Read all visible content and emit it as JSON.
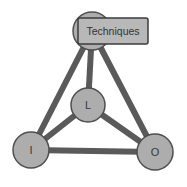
{
  "diagram": {
    "type": "node-link-graph",
    "background_color": "#ffffff",
    "edge_color": "#5a5a5a",
    "edge_width": 6,
    "node_fill": "#adadad",
    "node_stroke": "#4f4f4f",
    "node_stroke_width": 1.5,
    "label_box_fill": "#b8b8b8",
    "label_box_stroke": "#3d3d3d",
    "text_color": "#333333",
    "nodes": [
      {
        "id": "techniques",
        "label": "",
        "cx": 92,
        "cy": 31,
        "r": 19,
        "has_box_label": true,
        "box_label": "Techniques",
        "box_x": 78,
        "box_y": 18,
        "box_w": 70,
        "box_h": 26
      },
      {
        "id": "l",
        "label": "L",
        "cx": 88,
        "cy": 105,
        "r": 17,
        "has_box_label": false
      },
      {
        "id": "i",
        "label": "I",
        "cx": 31,
        "cy": 150,
        "r": 18,
        "has_box_label": false
      },
      {
        "id": "o",
        "label": "O",
        "cx": 155,
        "cy": 152,
        "r": 18,
        "has_box_label": false
      }
    ],
    "edges": [
      {
        "id": "edge-techniques-l",
        "from": "techniques",
        "to": "l",
        "x1": 92,
        "y1": 31,
        "x2": 88,
        "y2": 105
      },
      {
        "id": "edge-techniques-i",
        "from": "techniques",
        "to": "i",
        "x1": 92,
        "y1": 31,
        "x2": 31,
        "y2": 150
      },
      {
        "id": "edge-techniques-o",
        "from": "techniques",
        "to": "o",
        "x1": 92,
        "y1": 31,
        "x2": 155,
        "y2": 152
      },
      {
        "id": "edge-l-i",
        "from": "l",
        "to": "i",
        "x1": 88,
        "y1": 105,
        "x2": 31,
        "y2": 150
      },
      {
        "id": "edge-l-o",
        "from": "l",
        "to": "o",
        "x1": 88,
        "y1": 105,
        "x2": 155,
        "y2": 152
      },
      {
        "id": "edge-i-o",
        "from": "i",
        "to": "o",
        "x1": 31,
        "y1": 150,
        "x2": 155,
        "y2": 152
      }
    ]
  }
}
